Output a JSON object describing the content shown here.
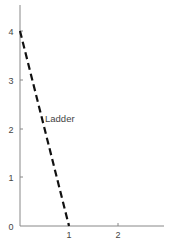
{
  "diagram": {
    "type": "ladder-against-wall",
    "y_axis": {
      "ticks": [
        {
          "value": 0,
          "label": "0"
        },
        {
          "value": 1,
          "label": "1"
        },
        {
          "value": 2,
          "label": "2"
        },
        {
          "value": 3,
          "label": "3"
        },
        {
          "value": 4,
          "label": "4"
        }
      ]
    },
    "x_axis": {
      "ticks": [
        {
          "value": 1,
          "label": "1"
        },
        {
          "value": 2,
          "label": "2"
        }
      ]
    },
    "ladder": {
      "label": "Ladder",
      "top": [
        0,
        4
      ],
      "bottom": [
        1,
        0
      ],
      "style": "dashed",
      "color": "#111111"
    },
    "axis_color": "#888888"
  }
}
